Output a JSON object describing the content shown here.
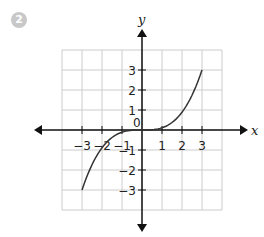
{
  "problem_number": "2",
  "graph": {
    "x_label": "x",
    "y_label": "y",
    "x_ticks": [
      "-3",
      "-2",
      "-1",
      "0",
      "1",
      "2",
      "3"
    ],
    "y_ticks": [
      "3",
      "2",
      "1",
      "-1",
      "-2",
      "-3"
    ],
    "grid_range": {
      "x": [
        -4,
        4
      ],
      "y": [
        -4,
        4
      ]
    },
    "curve": {
      "description": "increasing cubic-like curve through origin",
      "points": [
        [
          -3,
          -3
        ],
        [
          -2,
          -0.9
        ],
        [
          -1,
          -0.15
        ],
        [
          0,
          0
        ],
        [
          1,
          0.15
        ],
        [
          2,
          0.9
        ],
        [
          3,
          3
        ]
      ]
    },
    "colors": {
      "grid": "#cccccc",
      "axis": "#111111",
      "curve": "#333333",
      "badge": "#c8c8c8"
    }
  }
}
